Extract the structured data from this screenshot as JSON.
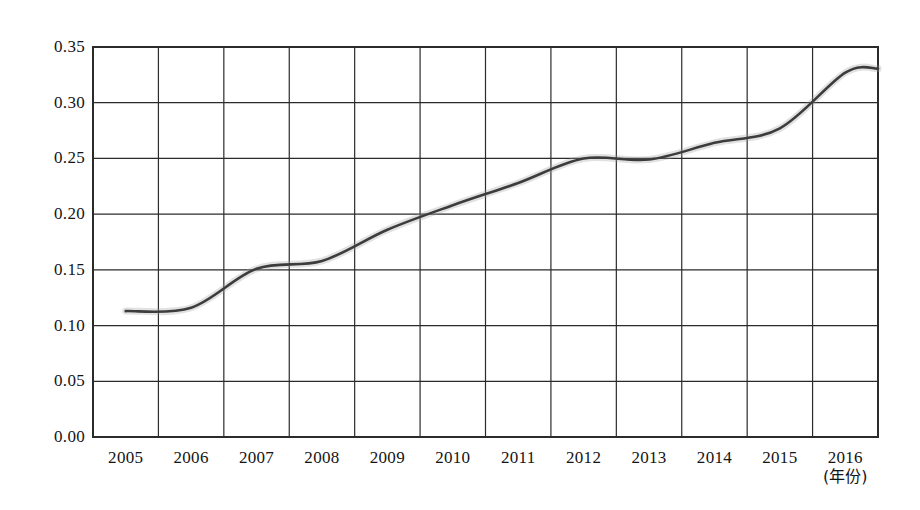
{
  "chart_data": {
    "type": "line",
    "title": "",
    "subtitle": "",
    "xlabel": "(年份)",
    "ylabel": "",
    "xlim": [
      2005,
      2016
    ],
    "ylim": [
      0.0,
      0.35
    ],
    "grid": true,
    "legend": null,
    "legend_position": "none",
    "line_color": "#3c3c3c",
    "categories": [
      "2005",
      "2006",
      "2007",
      "2008",
      "2009",
      "2010",
      "2011",
      "2012",
      "2013",
      "2014",
      "2015",
      "2016"
    ],
    "x": [
      2005,
      2006,
      2007,
      2008,
      2009,
      2010,
      2011,
      2012,
      2013,
      2014,
      2015,
      2016
    ],
    "values": [
      0.113,
      0.116,
      0.151,
      0.158,
      0.186,
      0.208,
      0.228,
      0.25,
      0.249,
      0.264,
      0.277,
      0.327
    ],
    "y_ticks": [
      "0.00",
      "0.05",
      "0.10",
      "0.15",
      "0.20",
      "0.25",
      "0.30",
      "0.35"
    ],
    "y_tick_values": [
      0.0,
      0.05,
      0.1,
      0.15,
      0.2,
      0.25,
      0.3,
      0.35
    ],
    "x_ticks": [
      "2005",
      "2006",
      "2007",
      "2008",
      "2009",
      "2010",
      "2011",
      "2012",
      "2013",
      "2014",
      "2015",
      "2016"
    ],
    "annotations": []
  },
  "axis": {
    "x_unit_label": "(年份)"
  }
}
